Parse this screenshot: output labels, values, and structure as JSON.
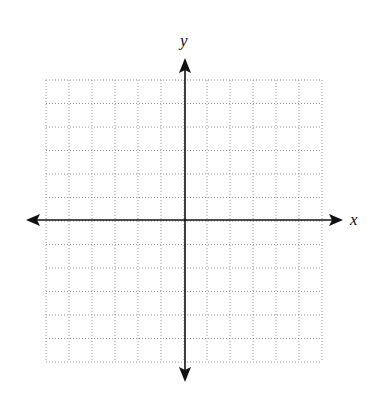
{
  "diagram": {
    "type": "coordinate-plane",
    "x_axis_label": "x",
    "y_axis_label": "y",
    "grid": {
      "columns": 12,
      "rows": 12,
      "style": "dotted",
      "color": "#9a9a9a"
    },
    "axis_color": "#111111"
  },
  "chart_data": {
    "type": "scatter",
    "title": "",
    "xlabel": "x",
    "ylabel": "y",
    "xlim": [
      -6,
      6
    ],
    "ylim": [
      -6,
      6
    ],
    "grid": true,
    "x": [],
    "y": []
  }
}
